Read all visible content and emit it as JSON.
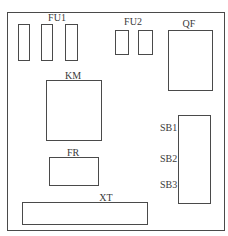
{
  "diagram": {
    "type": "component-layout",
    "frame": {
      "x": 7,
      "y": 12,
      "w": 218,
      "h": 219
    },
    "labels": {
      "fu1": "FU1",
      "fu2": "FU2",
      "qf": "QF",
      "km": "KM",
      "fr": "FR",
      "xt": "XT",
      "sb1": "SB1",
      "sb2": "SB2",
      "sb3": "SB3"
    },
    "components": [
      {
        "id": "FU1",
        "count": 3
      },
      {
        "id": "FU2",
        "count": 2
      },
      {
        "id": "QF",
        "count": 1
      },
      {
        "id": "KM",
        "count": 1
      },
      {
        "id": "FR",
        "count": 1
      },
      {
        "id": "XT",
        "count": 1
      },
      {
        "id": "SB",
        "buttons": [
          "SB1",
          "SB2",
          "SB3"
        ]
      }
    ]
  }
}
